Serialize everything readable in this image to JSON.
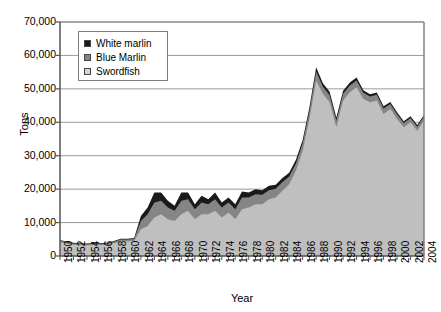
{
  "chart_data": {
    "type": "area",
    "stacked": true,
    "title": "",
    "xlabel": "Year",
    "ylabel": "Tons",
    "ylim": [
      0,
      70000
    ],
    "xlim": [
      1950,
      2004
    ],
    "grid": true,
    "legend_position": "top-left-inside",
    "y_ticks": [
      "0",
      "10,000",
      "20,000",
      "30,000",
      "40,000",
      "50,000",
      "60,000",
      "70,000"
    ],
    "y_tick_values": [
      0,
      10000,
      20000,
      30000,
      40000,
      50000,
      60000,
      70000
    ],
    "x_ticks": [
      "1950",
      "1952",
      "1954",
      "1956",
      "1958",
      "1960",
      "1962",
      "1964",
      "1966",
      "1968",
      "1970",
      "1972",
      "1974",
      "1976",
      "1978",
      "1980",
      "1982",
      "1984",
      "1986",
      "1988",
      "1990",
      "1992",
      "1994",
      "1996",
      "1998",
      "2000",
      "2002",
      "2004"
    ],
    "x": [
      1950,
      1951,
      1952,
      1953,
      1954,
      1955,
      1956,
      1957,
      1958,
      1959,
      1960,
      1961,
      1962,
      1963,
      1964,
      1965,
      1966,
      1967,
      1968,
      1969,
      1970,
      1971,
      1972,
      1973,
      1974,
      1975,
      1976,
      1977,
      1978,
      1979,
      1980,
      1981,
      1982,
      1983,
      1984,
      1985,
      1986,
      1987,
      1988,
      1989,
      1990,
      1991,
      1992,
      1993,
      1994,
      1995,
      1996,
      1997,
      1998,
      1999,
      2000,
      2001,
      2002,
      2003,
      2004
    ],
    "series": [
      {
        "name": "Swordfish",
        "color": "#bfbfbf",
        "values": [
          4200,
          3700,
          3400,
          3300,
          3200,
          3300,
          3200,
          3400,
          3800,
          4400,
          4400,
          4500,
          8000,
          9000,
          11500,
          12500,
          11000,
          10500,
          12500,
          13500,
          11000,
          12500,
          12500,
          13500,
          11500,
          13000,
          11000,
          14000,
          14500,
          15500,
          15500,
          17000,
          17500,
          19500,
          21500,
          25500,
          31500,
          41000,
          52500,
          48500,
          46000,
          38500,
          46500,
          49000,
          50500,
          47000,
          46000,
          46500,
          42500,
          44000,
          41000,
          38500,
          40000,
          37500,
          40500
        ]
      },
      {
        "name": "Blue Marlin",
        "color": "#858585",
        "values": [
          400,
          350,
          350,
          350,
          350,
          400,
          400,
          400,
          450,
          500,
          500,
          600,
          2500,
          3500,
          4500,
          4000,
          3500,
          3000,
          4000,
          3500,
          3000,
          3500,
          3000,
          3500,
          3000,
          3000,
          3000,
          3500,
          3000,
          3000,
          2800,
          2700,
          2600,
          2600,
          2300,
          2200,
          2200,
          2300,
          2700,
          2200,
          2100,
          2000,
          2000,
          2000,
          2000,
          1800,
          1700,
          1700,
          1600,
          1500,
          1400,
          1300,
          1300,
          1200,
          1200
        ]
      },
      {
        "name": "White marlin",
        "color": "#1a1a1a",
        "values": [
          200,
          200,
          200,
          200,
          200,
          200,
          200,
          200,
          250,
          250,
          250,
          300,
          1500,
          2000,
          3000,
          2500,
          2000,
          1500,
          2500,
          2000,
          1500,
          2000,
          1500,
          2000,
          1500,
          1500,
          1500,
          1800,
          1500,
          1500,
          1400,
          1300,
          1200,
          1200,
          1100,
          1100,
          1000,
          1100,
          1300,
          1000,
          1000,
          900,
          900,
          900,
          900,
          800,
          700,
          700,
          700,
          600,
          600,
          500,
          500,
          500,
          500
        ]
      }
    ]
  },
  "legend": {
    "items": [
      {
        "label": "White marlin",
        "color": "#1a1a1a"
      },
      {
        "label": "Blue Marlin",
        "color": "#858585"
      },
      {
        "label": "Swordfish",
        "color": "#d4d4d4"
      }
    ]
  },
  "axes": {
    "y_title": "Tons",
    "x_title": "Year"
  },
  "colors": {
    "plot_border": "#808080",
    "gridline": "#9a9a9a",
    "background": "#ffffff"
  }
}
